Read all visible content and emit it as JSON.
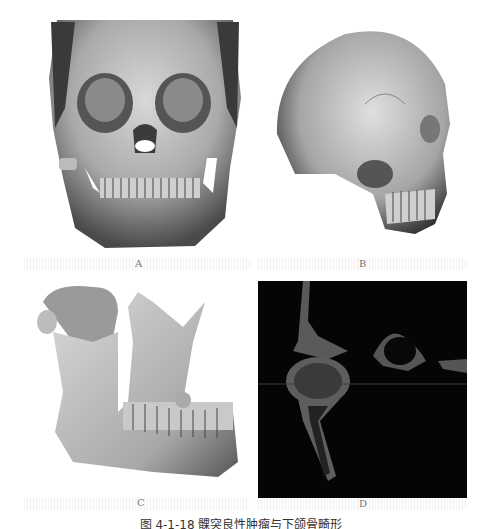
{
  "figure": {
    "panels": [
      {
        "id": "A",
        "label": "A",
        "description": "3D CT reconstruction of skull, frontal view"
      },
      {
        "id": "B",
        "label": "B",
        "description": "3D CT reconstruction of skull, lateral view"
      },
      {
        "id": "C",
        "label": "C",
        "description": "3D CT reconstruction of mandible with condylar mass, oblique view"
      },
      {
        "id": "D",
        "label": "D",
        "description": "CT coronal slice showing condyle, dark background"
      }
    ],
    "caption": "图 4-1-18  髁突良性肿瘤与下颌骨畸形"
  }
}
